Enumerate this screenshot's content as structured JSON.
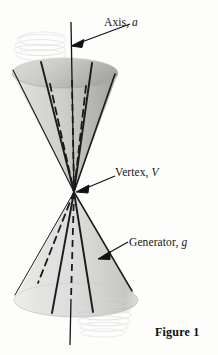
{
  "figure": {
    "caption": "Figure 1",
    "background_color": "#fdfdfc",
    "ink_color": "#161616"
  },
  "labels": {
    "axis": {
      "text": "Axis,",
      "symbol": "a",
      "full": "Axis, a"
    },
    "vertex": {
      "text": "Vertex,",
      "symbol": "V",
      "full": "Vertex, V"
    },
    "generator": {
      "text": "Generator,",
      "symbol": "g",
      "full": "Generator, g"
    }
  },
  "diagram": {
    "type": "double-cone",
    "vertex_point": {
      "x": 74,
      "y": 192
    },
    "axis_line": {
      "x": 71,
      "y_top": 22,
      "y_bottom": 345
    },
    "upper_nappe": {
      "rim_center": {
        "x": 65,
        "y": 73
      },
      "rim_rx": 53,
      "rim_ry": 15,
      "fill_light": "#e8e8e6",
      "fill_dark": "#b9b9b7"
    },
    "lower_nappe": {
      "rim_center": {
        "x": 76,
        "y": 300
      },
      "rim_rx": 62,
      "rim_ry": 17,
      "fill_light": "#ececea",
      "fill_dark": "#cfcfcd"
    },
    "generators_solid_upper": [
      {
        "x": 13,
        "y": 70
      },
      {
        "x": 41,
        "y": 62
      },
      {
        "x": 92,
        "y": 63
      },
      {
        "x": 115,
        "y": 74
      }
    ],
    "generators_dashed_upper": [
      {
        "x": 50,
        "y": 84
      },
      {
        "x": 71,
        "y": 88
      },
      {
        "x": 86,
        "y": 86
      }
    ],
    "generators_solid_lower": [
      {
        "x": 15,
        "y": 295
      },
      {
        "x": 52,
        "y": 313
      },
      {
        "x": 93,
        "y": 312
      },
      {
        "x": 132,
        "y": 291
      }
    ],
    "generators_dashed_lower": [
      {
        "x": 38,
        "y": 283
      },
      {
        "x": 71,
        "y": 290
      }
    ],
    "leader_axis": {
      "x1": 129,
      "y1": 24,
      "x2": 74,
      "y2": 45
    },
    "leader_vertex": {
      "x1": 113,
      "y1": 176,
      "x2": 77,
      "y2": 192
    },
    "leader_generator": {
      "x1": 127,
      "y1": 243,
      "x2": 99,
      "y2": 258
    }
  }
}
